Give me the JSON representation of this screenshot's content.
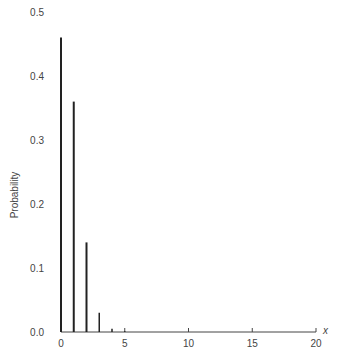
{
  "chart_data": {
    "type": "bar",
    "subtype": "stem",
    "title": "",
    "xlabel": "x",
    "ylabel": "Probability",
    "x": [
      0,
      1,
      2,
      3,
      4,
      5
    ],
    "values": [
      0.46,
      0.36,
      0.14,
      0.03,
      0.005,
      0.001
    ],
    "xlim": [
      0,
      20
    ],
    "ylim": [
      0,
      0.5
    ],
    "xticks": [
      0,
      5,
      10,
      15,
      20
    ],
    "yticks": [
      0.0,
      0.1,
      0.2,
      0.3,
      0.4,
      0.5
    ],
    "xtick_labels": [
      "0",
      "5",
      "10",
      "15",
      "20"
    ],
    "ytick_labels": [
      "0.0",
      "0.1",
      "0.2",
      "0.3",
      "0.4",
      "0.5"
    ],
    "grid": false,
    "legend": null,
    "colors": {
      "bars": "#222222",
      "axis": "#444444"
    }
  }
}
